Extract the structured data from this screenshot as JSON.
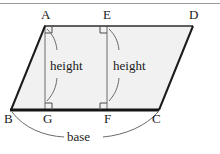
{
  "figure": {
    "type": "geometry-diagram",
    "shape": "parallelogram",
    "title_rule": true,
    "colors": {
      "outline": "#1a1a1a",
      "fill": "#f1f1f1",
      "thin_line": "#6b6b6b",
      "rule": "#9a9a9a",
      "text": "#1a1a1a"
    },
    "vertices": [
      {
        "name": "A",
        "x": 45,
        "y": 26,
        "label_x": 41,
        "label_y": 8
      },
      {
        "name": "E",
        "x": 107,
        "y": 26,
        "label_x": 103,
        "label_y": 8
      },
      {
        "name": "D",
        "x": 193,
        "y": 26,
        "label_x": 189,
        "label_y": 8
      },
      {
        "name": "B",
        "x": 11,
        "y": 110,
        "label_x": 4,
        "label_y": 112
      },
      {
        "name": "G",
        "x": 45,
        "y": 110,
        "label_x": 43,
        "label_y": 112
      },
      {
        "name": "F",
        "x": 107,
        "y": 110,
        "label_x": 104,
        "label_y": 112
      },
      {
        "name": "C",
        "x": 159,
        "y": 110,
        "label_x": 152,
        "label_y": 112
      }
    ],
    "segments": [
      {
        "name": "side-AD",
        "from": "A",
        "to": "D",
        "weight": "medium"
      },
      {
        "name": "side-AB",
        "from": "A",
        "to": "B",
        "weight": "medium"
      },
      {
        "name": "side-DC",
        "from": "D",
        "to": "C",
        "weight": "medium"
      },
      {
        "name": "base-BC",
        "from": "B",
        "to": "C",
        "weight": "thick"
      },
      {
        "name": "altitude-AG",
        "from": "A",
        "to": "G",
        "weight": "thin"
      },
      {
        "name": "altitude-EF",
        "from": "E",
        "to": "F",
        "weight": "thin"
      }
    ],
    "right_angles": [
      {
        "name": "right-angle-A",
        "x": 45,
        "y": 26,
        "dir": "down-right"
      },
      {
        "name": "right-angle-E",
        "x": 107,
        "y": 26,
        "dir": "down-left"
      },
      {
        "name": "right-angle-G",
        "x": 45,
        "y": 110,
        "dir": "up-right"
      },
      {
        "name": "right-angle-F",
        "x": 107,
        "y": 110,
        "dir": "up-left"
      }
    ],
    "annotations": [
      {
        "name": "height-label-left",
        "text": "height",
        "x": 50,
        "y": 59
      },
      {
        "name": "height-label-right",
        "text": "height",
        "x": 113,
        "y": 59
      },
      {
        "name": "base-label",
        "text": "base",
        "x": 67,
        "y": 130
      }
    ],
    "leaders": [
      {
        "name": "leader-A-to-height-left",
        "path": "M47,29 C53,35 56,41 57,50"
      },
      {
        "name": "leader-G-to-height-left",
        "path": "M57,78 C56,88 53,94 47,101"
      },
      {
        "name": "leader-E-to-height-right",
        "path": "M109,29 C115,35 118,41 119,50"
      },
      {
        "name": "leader-F-to-height-right",
        "path": "M119,78 C118,88 115,94 109,101"
      },
      {
        "name": "base-arc-left",
        "path": "M12,112 C24,128 44,136 64,137"
      },
      {
        "name": "base-arc-right",
        "path": "M103,137 C125,135 146,126 158,112"
      }
    ]
  }
}
